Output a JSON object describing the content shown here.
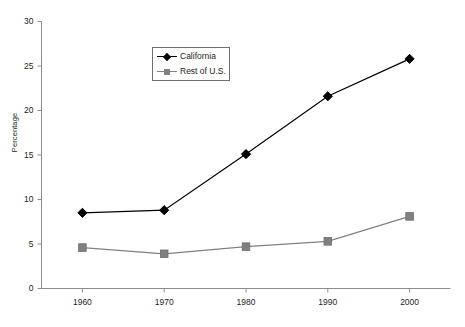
{
  "chart_data": {
    "type": "line",
    "title": "",
    "xlabel": "",
    "ylabel": "Percentage",
    "x": [
      1960,
      1970,
      1980,
      1990,
      2000
    ],
    "categories": [
      "1960",
      "1970",
      "1980",
      "1990",
      "2000"
    ],
    "series": [
      {
        "name": "California",
        "marker": "diamond",
        "color": "#000000",
        "values": [
          8.5,
          8.8,
          15.1,
          21.6,
          25.8
        ]
      },
      {
        "name": "Rest of U.S.",
        "marker": "square",
        "color": "#808080",
        "values": [
          4.6,
          3.9,
          4.7,
          5.3,
          8.1
        ]
      }
    ],
    "xlim": [
      1955,
      2005
    ],
    "ylim": [
      0,
      30
    ],
    "yticks": [
      0,
      5,
      10,
      15,
      20,
      25,
      30
    ],
    "ytick_labels": [
      "0",
      "5",
      "10",
      "15",
      "20",
      "25",
      "30"
    ],
    "xticks": [
      1960,
      1970,
      1980,
      1990,
      2000
    ],
    "xtick_labels": [
      "1960",
      "1970",
      "1980",
      "1990",
      "2000"
    ],
    "grid": false,
    "legend_position": "upper center",
    "legend_entries": [
      "California",
      "Rest of U.S."
    ],
    "axis_color": "#8c8c8c"
  }
}
